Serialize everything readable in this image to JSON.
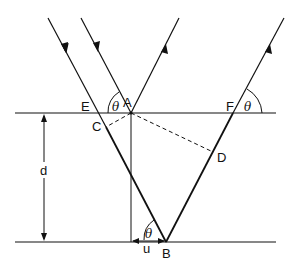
{
  "diagram": {
    "type": "thin-film reflection geometry",
    "labels": {
      "A": "A",
      "B": "B",
      "C": "C",
      "D": "D",
      "E": "E",
      "F": "F",
      "thickness": "d",
      "offset": "u",
      "angle_top_left": "θ",
      "angle_top_right": "θ",
      "angle_bottom": "θ"
    },
    "colors": {
      "line": "#111111",
      "background": "#ffffff"
    }
  }
}
